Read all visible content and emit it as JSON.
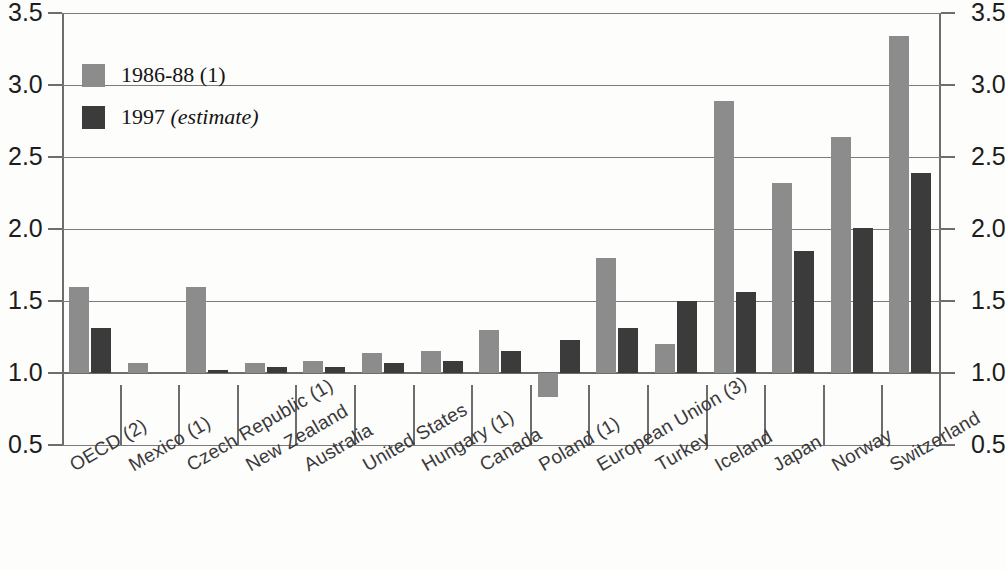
{
  "chart_data": {
    "type": "bar",
    "title": "",
    "subtitle": "",
    "xlabel": "",
    "ylabel": "",
    "ylim": [
      0.5,
      3.5
    ],
    "yticks": [
      "0.5",
      "1.0",
      "1.5",
      "2.0",
      "2.5",
      "3.0",
      "3.5"
    ],
    "ytick_values": [
      0.5,
      1.0,
      1.5,
      2.0,
      2.5,
      3.0,
      3.5
    ],
    "grid": "horizontal",
    "baseline": 1.0,
    "dual_y_axis": true,
    "legend_position": "top-left",
    "categories": [
      "OECD (2)",
      "Mexico (1)",
      "Czech Republic (1)",
      "New Zealand",
      "Australia",
      "United States",
      "Hungary (1)",
      "Canada",
      "Poland (1)",
      "European Union (3)",
      "Turkey",
      "Iceland",
      "Japan",
      "Norway",
      "Switzerland"
    ],
    "series": [
      {
        "name": "1986-88 (1)",
        "color": "#8c8c8c",
        "values": [
          1.6,
          1.07,
          1.6,
          1.07,
          1.08,
          1.14,
          1.15,
          1.3,
          0.83,
          1.8,
          1.2,
          2.89,
          2.32,
          2.64,
          3.34
        ]
      },
      {
        "name": "1997 (estimate)",
        "color": "#3b3b3b",
        "values": [
          1.31,
          null,
          1.02,
          1.04,
          1.04,
          1.07,
          1.08,
          1.15,
          1.23,
          1.31,
          1.5,
          1.56,
          1.85,
          2.01,
          2.39
        ]
      }
    ]
  },
  "legend": {
    "items": [
      {
        "label": "1986-88 (1)",
        "label_italic": "",
        "color": "#8c8c8c"
      },
      {
        "label": "1997 ",
        "label_italic": "(estimate)",
        "color": "#3b3b3b"
      }
    ]
  },
  "colors": {
    "series_1986_88": "#8c8c8c",
    "series_1997": "#3b3b3b",
    "axis": "#6d6d6d",
    "grid": "#7b7b7b",
    "text": "#1d1d1d",
    "background": "#fdfdfc"
  }
}
